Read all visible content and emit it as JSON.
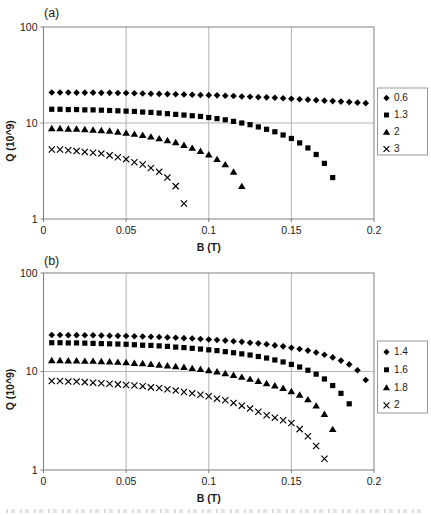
{
  "figure": {
    "background": "#ffffff",
    "marker_color": "#000000",
    "grid_color": "#b3b3b3",
    "axis_color": "#808080",
    "text_color": "#1a1a1a",
    "legend_border_color": "#999999",
    "has_cropped_caption_fragment": true
  },
  "chart_data": [
    {
      "type": "scatter",
      "panel_label": "(a)",
      "xlabel": "B (T)",
      "ylabel": "Q (10^9)",
      "y_scale": "log",
      "xlim": [
        0,
        0.2
      ],
      "ylim": [
        1,
        100
      ],
      "x_ticks": [
        0,
        0.05,
        0.1,
        0.15,
        0.2
      ],
      "x_tick_labels": [
        "0",
        "0.05",
        "0.1",
        "0.15",
        "0.2"
      ],
      "y_ticks": [
        1,
        10,
        100
      ],
      "y_tick_labels": [
        "1",
        "10",
        "100"
      ],
      "grid": true,
      "legend_position": "right",
      "series": [
        {
          "name": "0.6",
          "marker": "diamond",
          "x": [
            0.005,
            0.01,
            0.015,
            0.02,
            0.025,
            0.03,
            0.035,
            0.04,
            0.045,
            0.05,
            0.055,
            0.06,
            0.065,
            0.07,
            0.075,
            0.08,
            0.085,
            0.09,
            0.095,
            0.1,
            0.105,
            0.11,
            0.115,
            0.12,
            0.125,
            0.13,
            0.135,
            0.14,
            0.145,
            0.15,
            0.155,
            0.16,
            0.165,
            0.17,
            0.175,
            0.18,
            0.185,
            0.19,
            0.195
          ],
          "y": [
            20.8,
            20.8,
            20.8,
            20.7,
            20.7,
            20.7,
            20.6,
            20.6,
            20.5,
            20.5,
            20.4,
            20.3,
            20.2,
            20.1,
            20.0,
            19.9,
            19.8,
            19.7,
            19.6,
            19.5,
            19.4,
            19.2,
            19.1,
            18.9,
            18.8,
            18.6,
            18.5,
            18.3,
            18.1,
            17.9,
            17.7,
            17.5,
            17.3,
            17.1,
            16.9,
            16.7,
            16.5,
            16.3,
            16.1
          ]
        },
        {
          "name": "1.3",
          "marker": "square",
          "x": [
            0.005,
            0.01,
            0.015,
            0.02,
            0.025,
            0.03,
            0.035,
            0.04,
            0.045,
            0.05,
            0.055,
            0.06,
            0.065,
            0.07,
            0.075,
            0.08,
            0.085,
            0.09,
            0.095,
            0.1,
            0.105,
            0.11,
            0.115,
            0.12,
            0.125,
            0.13,
            0.135,
            0.14,
            0.145,
            0.15,
            0.155,
            0.16,
            0.165,
            0.17,
            0.175
          ],
          "y": [
            13.9,
            13.9,
            13.8,
            13.8,
            13.7,
            13.7,
            13.6,
            13.5,
            13.4,
            13.3,
            13.2,
            13.0,
            12.9,
            12.7,
            12.5,
            12.3,
            12.1,
            11.9,
            11.7,
            11.4,
            11.1,
            10.8,
            10.4,
            10.0,
            9.6,
            9.1,
            8.6,
            8.1,
            7.5,
            6.9,
            6.2,
            5.5,
            4.7,
            3.8,
            2.7
          ]
        },
        {
          "name": "2",
          "marker": "triangle",
          "x": [
            0.005,
            0.01,
            0.015,
            0.02,
            0.025,
            0.03,
            0.035,
            0.04,
            0.045,
            0.05,
            0.055,
            0.06,
            0.065,
            0.07,
            0.075,
            0.08,
            0.085,
            0.09,
            0.095,
            0.1,
            0.105,
            0.11,
            0.115,
            0.12
          ],
          "y": [
            8.8,
            8.8,
            8.7,
            8.7,
            8.6,
            8.5,
            8.4,
            8.3,
            8.1,
            7.9,
            7.7,
            7.5,
            7.2,
            6.9,
            6.6,
            6.3,
            5.9,
            5.5,
            5.1,
            4.7,
            4.2,
            3.7,
            3.1,
            2.2
          ]
        },
        {
          "name": "3",
          "marker": "x",
          "x": [
            0.005,
            0.01,
            0.015,
            0.02,
            0.025,
            0.03,
            0.035,
            0.04,
            0.045,
            0.05,
            0.055,
            0.06,
            0.065,
            0.07,
            0.075,
            0.08,
            0.085
          ],
          "y": [
            5.3,
            5.3,
            5.2,
            5.1,
            5.0,
            4.9,
            4.8,
            4.6,
            4.4,
            4.2,
            3.9,
            3.7,
            3.4,
            3.1,
            2.7,
            2.2,
            1.45
          ]
        }
      ]
    },
    {
      "type": "scatter",
      "panel_label": "(b)",
      "xlabel": "B (T)",
      "ylabel": "Q (10^9)",
      "y_scale": "log",
      "xlim": [
        0,
        0.2
      ],
      "ylim": [
        1,
        100
      ],
      "x_ticks": [
        0,
        0.05,
        0.1,
        0.15,
        0.2
      ],
      "x_tick_labels": [
        "0",
        "0.05",
        "0.1",
        "0.15",
        "0.2"
      ],
      "y_ticks": [
        1,
        10,
        100
      ],
      "y_tick_labels": [
        "1",
        "10",
        "100"
      ],
      "grid": true,
      "legend_position": "right",
      "series": [
        {
          "name": "1.4",
          "marker": "diamond",
          "x": [
            0.005,
            0.01,
            0.015,
            0.02,
            0.025,
            0.03,
            0.035,
            0.04,
            0.045,
            0.05,
            0.055,
            0.06,
            0.065,
            0.07,
            0.075,
            0.08,
            0.085,
            0.09,
            0.095,
            0.1,
            0.105,
            0.11,
            0.115,
            0.12,
            0.125,
            0.13,
            0.135,
            0.14,
            0.145,
            0.15,
            0.155,
            0.16,
            0.165,
            0.17,
            0.175,
            0.18,
            0.185,
            0.19,
            0.195
          ],
          "y": [
            23.5,
            23.5,
            23.4,
            23.4,
            23.3,
            23.3,
            23.2,
            23.1,
            23.0,
            22.9,
            22.8,
            22.7,
            22.5,
            22.4,
            22.2,
            22.0,
            21.8,
            21.6,
            21.4,
            21.1,
            20.9,
            20.6,
            20.3,
            20.0,
            19.6,
            19.3,
            18.9,
            18.4,
            18.0,
            17.4,
            16.9,
            16.3,
            15.6,
            14.8,
            13.9,
            12.9,
            11.8,
            10.3,
            8.2
          ]
        },
        {
          "name": "1.6",
          "marker": "square",
          "x": [
            0.005,
            0.01,
            0.015,
            0.02,
            0.025,
            0.03,
            0.035,
            0.04,
            0.045,
            0.05,
            0.055,
            0.06,
            0.065,
            0.07,
            0.075,
            0.08,
            0.085,
            0.09,
            0.095,
            0.1,
            0.105,
            0.11,
            0.115,
            0.12,
            0.125,
            0.13,
            0.135,
            0.14,
            0.145,
            0.15,
            0.155,
            0.16,
            0.165,
            0.17,
            0.175,
            0.18,
            0.185
          ],
          "y": [
            19.6,
            19.6,
            19.5,
            19.5,
            19.4,
            19.3,
            19.2,
            19.1,
            19.0,
            18.9,
            18.7,
            18.5,
            18.4,
            18.2,
            18.0,
            17.7,
            17.5,
            17.2,
            16.9,
            16.6,
            16.3,
            15.9,
            15.5,
            15.1,
            14.7,
            14.2,
            13.7,
            13.1,
            12.5,
            11.8,
            11.1,
            10.3,
            9.4,
            8.4,
            7.2,
            6.0,
            4.7
          ]
        },
        {
          "name": "1.8",
          "marker": "triangle",
          "x": [
            0.005,
            0.01,
            0.015,
            0.02,
            0.025,
            0.03,
            0.035,
            0.04,
            0.045,
            0.05,
            0.055,
            0.06,
            0.065,
            0.07,
            0.075,
            0.08,
            0.085,
            0.09,
            0.095,
            0.1,
            0.105,
            0.11,
            0.115,
            0.12,
            0.125,
            0.13,
            0.135,
            0.14,
            0.145,
            0.15,
            0.155,
            0.16,
            0.165,
            0.17,
            0.175
          ],
          "y": [
            13.0,
            13.0,
            12.9,
            12.9,
            12.8,
            12.8,
            12.7,
            12.6,
            12.5,
            12.4,
            12.2,
            12.1,
            11.9,
            11.7,
            11.5,
            11.3,
            11.1,
            10.8,
            10.6,
            10.3,
            10.0,
            9.6,
            9.2,
            8.8,
            8.4,
            8.0,
            7.6,
            7.2,
            6.8,
            6.3,
            5.8,
            5.2,
            4.5,
            3.7,
            2.6
          ]
        },
        {
          "name": "2",
          "marker": "x",
          "x": [
            0.005,
            0.01,
            0.015,
            0.02,
            0.025,
            0.03,
            0.035,
            0.04,
            0.045,
            0.05,
            0.055,
            0.06,
            0.065,
            0.07,
            0.075,
            0.08,
            0.085,
            0.09,
            0.095,
            0.1,
            0.105,
            0.11,
            0.115,
            0.12,
            0.125,
            0.13,
            0.135,
            0.14,
            0.145,
            0.15,
            0.155,
            0.16,
            0.165,
            0.17
          ],
          "y": [
            8.0,
            8.0,
            7.9,
            7.9,
            7.8,
            7.7,
            7.6,
            7.5,
            7.4,
            7.3,
            7.2,
            7.1,
            6.9,
            6.8,
            6.6,
            6.4,
            6.2,
            6.0,
            5.8,
            5.6,
            5.3,
            5.1,
            4.8,
            4.5,
            4.2,
            3.9,
            3.6,
            3.4,
            3.2,
            3.0,
            2.6,
            2.2,
            1.75,
            1.3
          ]
        }
      ]
    }
  ]
}
